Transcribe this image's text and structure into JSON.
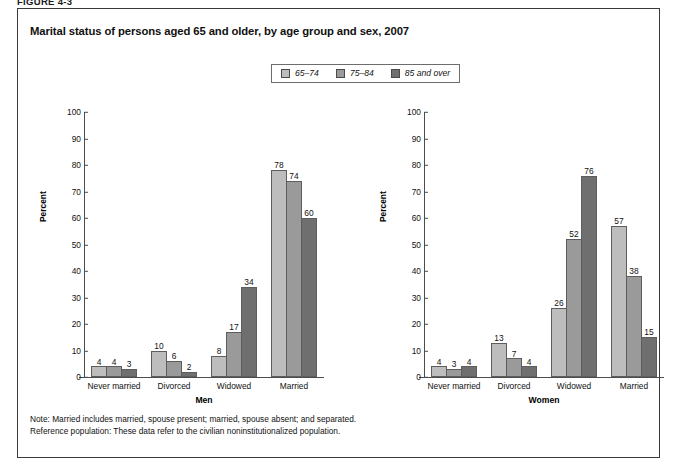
{
  "figure_label": "FIGURE 4-3",
  "chart_title": "Marital status of persons aged 65 and older, by age group and sex, 2007",
  "legend": {
    "items": [
      {
        "label": "65–74",
        "color": "#bdbdbd"
      },
      {
        "label": "75–84",
        "color": "#9a9a9a"
      },
      {
        "label": "85 and over",
        "color": "#6f6f6f"
      }
    ]
  },
  "notes": [
    "Note: Married includes married, spouse present; married, spouse absent; and separated.",
    "Reference population: These data refer to the civilian noninstitutionalized population."
  ],
  "chart_data": [
    {
      "type": "bar",
      "title": "Men",
      "xlabel": "Men",
      "ylabel": "Percent",
      "ylim": [
        0,
        100
      ],
      "yticks": [
        0,
        10,
        20,
        30,
        40,
        50,
        60,
        70,
        80,
        90,
        100
      ],
      "grid": false,
      "legend_position": "top-center",
      "categories": [
        "Never married",
        "Divorced",
        "Widowed",
        "Married"
      ],
      "series": [
        {
          "name": "65–74",
          "color": "#bdbdbd",
          "values": [
            4,
            10,
            8,
            78
          ]
        },
        {
          "name": "75–84",
          "color": "#9a9a9a",
          "values": [
            4,
            6,
            17,
            74
          ]
        },
        {
          "name": "85 and over",
          "color": "#6f6f6f",
          "values": [
            3,
            2,
            34,
            60
          ]
        }
      ]
    },
    {
      "type": "bar",
      "title": "Women",
      "xlabel": "Women",
      "ylabel": "Percent",
      "ylim": [
        0,
        100
      ],
      "yticks": [
        0,
        10,
        20,
        30,
        40,
        50,
        60,
        70,
        80,
        90,
        100
      ],
      "grid": false,
      "legend_position": "top-center",
      "categories": [
        "Never married",
        "Divorced",
        "Widowed",
        "Married"
      ],
      "series": [
        {
          "name": "65–74",
          "color": "#bdbdbd",
          "values": [
            4,
            13,
            26,
            57
          ]
        },
        {
          "name": "75–84",
          "color": "#9a9a9a",
          "values": [
            3,
            7,
            52,
            38
          ]
        },
        {
          "name": "85 and over",
          "color": "#6f6f6f",
          "values": [
            4,
            4,
            76,
            15
          ]
        }
      ]
    }
  ]
}
